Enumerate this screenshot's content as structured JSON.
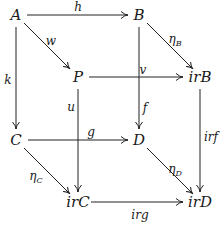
{
  "diagram": {
    "type": "commutative-cube",
    "stroke_color": "#222222",
    "nodes": {
      "A": {
        "label": "A",
        "x": 16,
        "y": 15
      },
      "B": {
        "label": "B",
        "x": 139,
        "y": 15
      },
      "P": {
        "label": "P",
        "x": 78,
        "y": 77
      },
      "irB": {
        "label": "irB",
        "x": 198,
        "y": 77
      },
      "C": {
        "label": "C",
        "x": 16,
        "y": 140
      },
      "D": {
        "label": "D",
        "x": 139,
        "y": 140
      },
      "irC": {
        "label": "irC",
        "x": 78,
        "y": 202
      },
      "irD": {
        "label": "irD",
        "x": 198,
        "y": 202
      }
    },
    "edges": [
      {
        "id": "h",
        "from": "A",
        "to": "B",
        "label": "h"
      },
      {
        "id": "w",
        "from": "A",
        "to": "P",
        "label": "w"
      },
      {
        "id": "k",
        "from": "A",
        "to": "C",
        "label": "k"
      },
      {
        "id": "etaB",
        "from": "B",
        "to": "irB",
        "label": "η",
        "sub": "B"
      },
      {
        "id": "f",
        "from": "B",
        "to": "D",
        "label": "f"
      },
      {
        "id": "v",
        "from": "P",
        "to": "irB",
        "label": "v"
      },
      {
        "id": "u",
        "from": "P",
        "to": "irC",
        "label": "u"
      },
      {
        "id": "irf",
        "from": "irB",
        "to": "irD",
        "label": "irf"
      },
      {
        "id": "g",
        "from": "C",
        "to": "D",
        "label": "g"
      },
      {
        "id": "etaC",
        "from": "C",
        "to": "irC",
        "label": "η",
        "sub": "C"
      },
      {
        "id": "etaD",
        "from": "D",
        "to": "irD",
        "label": "η",
        "sub": "D"
      },
      {
        "id": "irg",
        "from": "irC",
        "to": "irD",
        "label": "irg"
      }
    ],
    "labels": {
      "h": "h",
      "w": "w",
      "k": "k",
      "v": "v",
      "u": "u",
      "f": "f",
      "g": "g",
      "irf": "irf",
      "irg": "irg",
      "eta": "η",
      "sub_B": "B",
      "sub_C": "C",
      "sub_D": "D"
    }
  }
}
